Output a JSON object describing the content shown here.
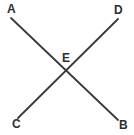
{
  "figure": {
    "type": "geometry-diagram",
    "width": 134,
    "height": 135,
    "background_color": "#ffffff",
    "line_color": "#3a3a3a",
    "label_color": "#2e2e2e",
    "line_width": 1.8,
    "labels": {
      "a": "A",
      "b": "B",
      "c": "C",
      "d": "D",
      "e": "E"
    },
    "segments": [
      {
        "name": "segment-ab",
        "from_label": "A",
        "to_label": "B",
        "x1": 11,
        "y1": 18,
        "x2": 118,
        "y2": 120
      },
      {
        "name": "segment-cd",
        "from_label": "C",
        "to_label": "D",
        "x1": 18,
        "y1": 118,
        "x2": 118,
        "y2": 19
      }
    ],
    "intersection": {
      "label": "E",
      "x": 67,
      "y": 69
    }
  }
}
